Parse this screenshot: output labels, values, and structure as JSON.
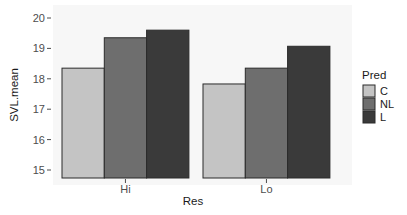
{
  "chart_data": {
    "type": "bar",
    "title": "",
    "xlabel": "Res",
    "ylabel": "SVL.mean",
    "categories": [
      "Hi",
      "Lo"
    ],
    "series": [
      {
        "name": "C",
        "color": "#c4c4c4",
        "values": [
          18.35,
          17.83
        ]
      },
      {
        "name": "NL",
        "color": "#6e6e6e",
        "values": [
          19.35,
          18.35
        ]
      },
      {
        "name": "L",
        "color": "#3a3a3a",
        "values": [
          19.6,
          19.07
        ]
      }
    ],
    "ylim": [
      14.75,
      20.1
    ],
    "yticks": [
      15,
      16,
      17,
      18,
      19,
      20
    ],
    "grid": false,
    "legend": {
      "title": "Pred",
      "position": "right",
      "entries": [
        "C",
        "NL",
        "L"
      ]
    },
    "panel_background": "#f7f7f7",
    "bar_outline": "#2b2b2b"
  }
}
